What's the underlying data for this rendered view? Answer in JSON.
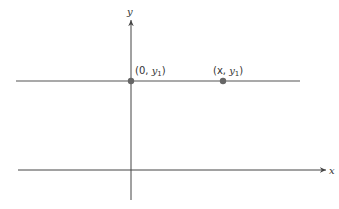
{
  "diagram": {
    "type": "coordinate-plane",
    "axes": {
      "x_label": "x",
      "y_label": "y"
    },
    "horizontal_line": {
      "description": "horizontal line y = y1"
    },
    "points": [
      {
        "label_prefix": "(0, ",
        "label_var": "y",
        "label_sub": "1",
        "label_suffix": ")"
      },
      {
        "label_prefix": "(x, ",
        "label_var": "y",
        "label_sub": "1",
        "label_suffix": ")"
      }
    ],
    "colors": {
      "line": "#555555",
      "point": "#666666",
      "text": "#333333"
    }
  }
}
